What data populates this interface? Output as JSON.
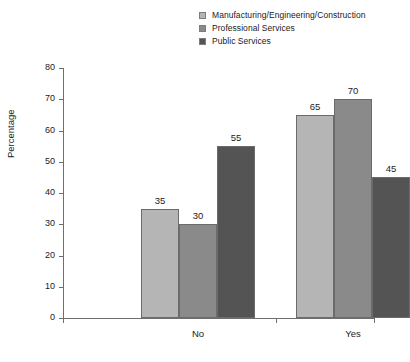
{
  "chart_data": {
    "type": "bar",
    "title": "",
    "subtitle": "",
    "xlabel": "",
    "ylabel": "Percentage",
    "categories": [
      "No",
      "Yes"
    ],
    "series": [
      {
        "name": "Manufacturing/Engineering/Construction",
        "color": "#b5b5b5",
        "values": [
          35,
          65
        ]
      },
      {
        "name": "Professional Services",
        "color": "#8a8a8a",
        "values": [
          30,
          70
        ]
      },
      {
        "name": "Public Services",
        "color": "#545454",
        "values": [
          55,
          45
        ]
      }
    ],
    "ylim": [
      0,
      80
    ],
    "ytick_step": 10,
    "yticks": [
      "0",
      "10",
      "20",
      "30",
      "40",
      "50",
      "60",
      "70",
      "80"
    ],
    "grid": false,
    "legend_position": "top",
    "data_labels": true,
    "bar_group_gap": true
  },
  "legend": {
    "items": [
      {
        "label": "Manufacturing/Engineering/Construction",
        "color": "#b5b5b5"
      },
      {
        "label": "Professional Services",
        "color": "#8a8a8a"
      },
      {
        "label": "Public Services",
        "color": "#545454"
      }
    ]
  },
  "axes": {
    "y_title": "Percentage"
  }
}
